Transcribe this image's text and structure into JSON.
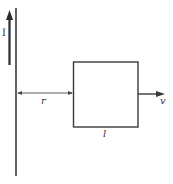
{
  "diagram": {
    "labels": {
      "current": "I",
      "distance": "r",
      "side_length": "l",
      "velocity": "v"
    },
    "colors": {
      "stroke": "#3a3a3a",
      "background": "#ffffff"
    }
  }
}
